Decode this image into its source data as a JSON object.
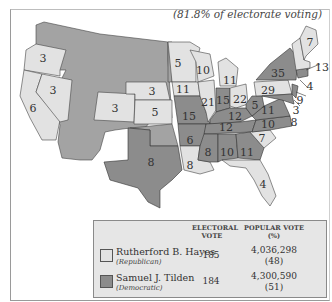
{
  "subtitle": "(81.8% of electorate voting)",
  "colors": {
    "republican": "#e2e2e2",
    "democratic": "#8c8c8c",
    "territory": "#a3a3a3"
  },
  "states": [
    {
      "name": "Oregon",
      "ev": "3",
      "party": "R"
    },
    {
      "name": "California",
      "ev": "6",
      "party": "R"
    },
    {
      "name": "Nevada",
      "ev": "3",
      "party": "R"
    },
    {
      "name": "Colorado",
      "ev": "3",
      "party": "R"
    },
    {
      "name": "Nebraska",
      "ev": "3",
      "party": "R"
    },
    {
      "name": "Kansas",
      "ev": "5",
      "party": "R"
    },
    {
      "name": "Texas",
      "ev": "8",
      "party": "D"
    },
    {
      "name": "Minnesota",
      "ev": "5",
      "party": "R"
    },
    {
      "name": "Iowa",
      "ev": "11",
      "party": "R"
    },
    {
      "name": "Missouri",
      "ev": "15",
      "party": "D"
    },
    {
      "name": "Arkansas",
      "ev": "6",
      "party": "D"
    },
    {
      "name": "Louisiana",
      "ev": "8",
      "party": "R"
    },
    {
      "name": "Wisconsin",
      "ev": "10",
      "party": "R"
    },
    {
      "name": "Illinois",
      "ev": "21",
      "party": "R"
    },
    {
      "name": "Michigan",
      "ev": "11",
      "party": "R"
    },
    {
      "name": "Indiana",
      "ev": "15",
      "party": "D"
    },
    {
      "name": "Ohio",
      "ev": "22",
      "party": "R"
    },
    {
      "name": "Kentucky",
      "ev": "12",
      "party": "D"
    },
    {
      "name": "Tennessee",
      "ev": "12",
      "party": "D"
    },
    {
      "name": "Mississippi",
      "ev": "8",
      "party": "D"
    },
    {
      "name": "Alabama",
      "ev": "10",
      "party": "D"
    },
    {
      "name": "Georgia",
      "ev": "11",
      "party": "D"
    },
    {
      "name": "Florida",
      "ev": "4",
      "party": "R"
    },
    {
      "name": "South Carolina",
      "ev": "7",
      "party": "R"
    },
    {
      "name": "North Carolina",
      "ev": "10",
      "party": "D"
    },
    {
      "name": "Virginia",
      "ev": "11",
      "party": "D"
    },
    {
      "name": "West Virginia",
      "ev": "5",
      "party": "D"
    },
    {
      "name": "Pennsylvania",
      "ev": "29",
      "party": "R"
    },
    {
      "name": "New York",
      "ev": "35",
      "party": "D"
    },
    {
      "name": "Maine",
      "ev": "7",
      "party": "R"
    },
    {
      "name": "Massachusetts",
      "ev": "13",
      "party": "R"
    },
    {
      "name": "Connecticut",
      "ev": "4",
      "party": "D"
    },
    {
      "name": "New Jersey",
      "ev": "9",
      "party": "D"
    },
    {
      "name": "Delaware",
      "ev": "3",
      "party": "D"
    },
    {
      "name": "Maryland",
      "ev": "8",
      "party": "D"
    }
  ],
  "legend": {
    "header_electoral": [
      "ELECTORAL",
      "VOTE"
    ],
    "header_popular": [
      "POPULAR VOTE",
      "(%)"
    ],
    "candidates": [
      {
        "name": "Rutherford B. Hayes",
        "party": "(Republican)",
        "electoral": "185",
        "popular": "4,036,298",
        "percent": "(48)"
      },
      {
        "name": "Samuel J. Tilden",
        "party": "(Democratic)",
        "electoral": "184",
        "popular": "4,300,590",
        "percent": "(51)"
      }
    ]
  }
}
